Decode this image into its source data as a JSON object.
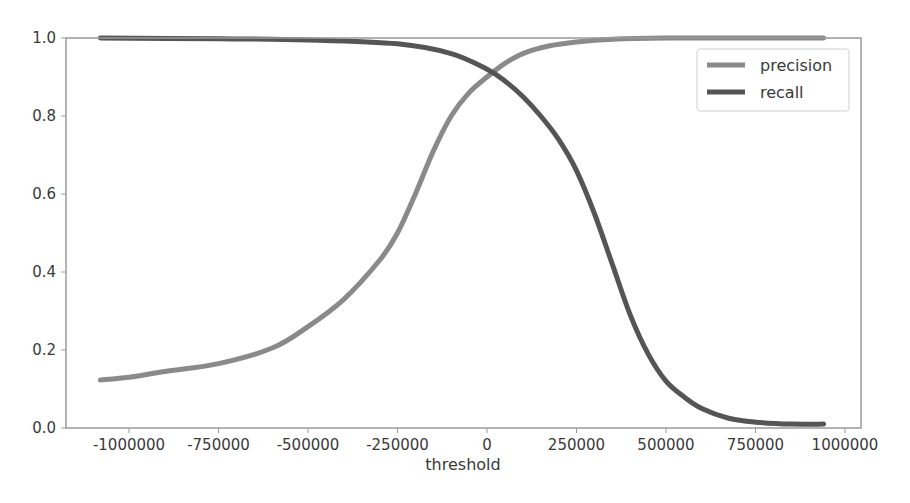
{
  "chart_data": {
    "type": "line",
    "title": "",
    "xlabel": "threshold",
    "ylabel": "",
    "xlim": [
      -1180000,
      1040000
    ],
    "ylim": [
      0.0,
      1.0
    ],
    "grid": false,
    "legend_position": "upper right",
    "x_ticks": [
      -1000000,
      -750000,
      -500000,
      -250000,
      0,
      250000,
      500000,
      750000,
      1000000
    ],
    "x_tick_labels": [
      "-1000000",
      "-750000",
      "-500000",
      "-250000",
      "0",
      "250000",
      "500000",
      "750000",
      "1000000"
    ],
    "y_ticks": [
      0.0,
      0.2,
      0.4,
      0.6,
      0.8,
      1.0
    ],
    "y_tick_labels": [
      "0.0",
      "0.2",
      "0.4",
      "0.6",
      "0.8",
      "1.0"
    ],
    "series": [
      {
        "name": "precision",
        "color": "#8a8a8a",
        "x": [
          -1080000,
          -1000000,
          -900000,
          -750000,
          -600000,
          -500000,
          -400000,
          -300000,
          -250000,
          -200000,
          -150000,
          -100000,
          -50000,
          0,
          50000,
          100000,
          175000,
          250000,
          350000,
          500000,
          750000,
          940000
        ],
        "y": [
          0.123,
          0.13,
          0.145,
          0.165,
          0.205,
          0.26,
          0.33,
          0.43,
          0.5,
          0.6,
          0.71,
          0.8,
          0.86,
          0.9,
          0.935,
          0.96,
          0.98,
          0.99,
          0.997,
          1.0,
          1.0,
          1.0
        ]
      },
      {
        "name": "recall",
        "color": "#555555",
        "x": [
          -1080000,
          -750000,
          -500000,
          -250000,
          -100000,
          0,
          50000,
          100000,
          150000,
          200000,
          250000,
          300000,
          350000,
          400000,
          450000,
          500000,
          550000,
          600000,
          675000,
          750000,
          850000,
          940000
        ],
        "y": [
          1.0,
          0.998,
          0.995,
          0.985,
          0.96,
          0.92,
          0.89,
          0.85,
          0.8,
          0.74,
          0.66,
          0.55,
          0.42,
          0.29,
          0.19,
          0.12,
          0.08,
          0.05,
          0.025,
          0.015,
          0.01,
          0.01
        ]
      }
    ]
  },
  "legend": {
    "items": [
      {
        "label": "precision",
        "color": "#8a8a8a"
      },
      {
        "label": "recall",
        "color": "#555555"
      }
    ]
  }
}
